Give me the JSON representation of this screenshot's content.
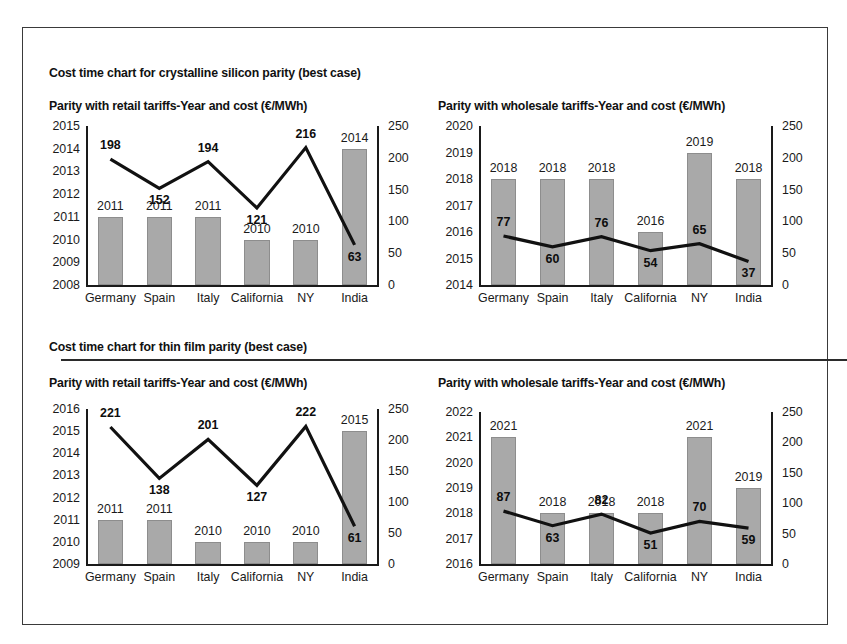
{
  "page": {
    "background": "#ffffff",
    "frame_color": "#3a3a3a",
    "bar_color": "#a9a9a9",
    "line_color": "#111111"
  },
  "sections": [
    {
      "title": "Cost time chart for crystalline silicon parity (best case)"
    },
    {
      "title": "Cost time chart for thin film parity (best case)"
    }
  ],
  "charts": [
    {
      "title": "Parity with retail tariffs-Year and cost (€/MWh)",
      "categories": [
        "Germany",
        "Spain",
        "Italy",
        "California",
        "NY",
        "India"
      ],
      "bar_values": [
        2011,
        2011,
        2011,
        2010,
        2010,
        2014
      ],
      "bar_labels": [
        "2011",
        "2011",
        "2011",
        "2010",
        "2010",
        "2014"
      ],
      "line_values": [
        198,
        152,
        194,
        121,
        216,
        63
      ],
      "line_labels": [
        "198",
        "152",
        "194",
        "121",
        "216",
        "63"
      ],
      "left_ticks": [
        "2015",
        "2014",
        "2013",
        "2012",
        "2011",
        "2010",
        "2009",
        "2008"
      ],
      "right_ticks": [
        "250",
        "200",
        "150",
        "100",
        "50",
        "0"
      ],
      "left_min": 2008,
      "left_max": 2015,
      "right_min": 0,
      "right_max": 250
    },
    {
      "title": "Parity with wholesale tariffs-Year and cost (€/MWh)",
      "categories": [
        "Germany",
        "Spain",
        "Italy",
        "California",
        "NY",
        "India"
      ],
      "bar_values": [
        2018,
        2018,
        2018,
        2016,
        2019,
        2018
      ],
      "bar_labels": [
        "2018",
        "2018",
        "2018",
        "2016",
        "2019",
        "2018"
      ],
      "line_values": [
        77,
        60,
        76,
        54,
        65,
        37
      ],
      "line_labels": [
        "77",
        "60",
        "76",
        "54",
        "65",
        "37"
      ],
      "left_ticks": [
        "2020",
        "2019",
        "2018",
        "2017",
        "2016",
        "2015",
        "2014"
      ],
      "right_ticks": [
        "250",
        "200",
        "150",
        "100",
        "50",
        "0"
      ],
      "left_min": 2014,
      "left_max": 2020,
      "right_min": 0,
      "right_max": 250
    },
    {
      "title": "Parity with retail tariffs-Year and cost (€/MWh)",
      "categories": [
        "Germany",
        "Spain",
        "Italy",
        "California",
        "NY",
        "India"
      ],
      "bar_values": [
        2011,
        2011,
        2010,
        2010,
        2010,
        2015
      ],
      "bar_labels": [
        "2011",
        "2011",
        "2010",
        "2010",
        "2010",
        "2015"
      ],
      "line_values": [
        221,
        138,
        201,
        127,
        222,
        61
      ],
      "line_labels": [
        "221",
        "138",
        "201",
        "127",
        "222",
        "61"
      ],
      "left_ticks": [
        "2016",
        "2015",
        "2014",
        "2013",
        "2012",
        "2011",
        "2010",
        "2009"
      ],
      "right_ticks": [
        "250",
        "200",
        "150",
        "100",
        "50",
        "0"
      ],
      "left_min": 2009,
      "left_max": 2016,
      "right_min": 0,
      "right_max": 250
    },
    {
      "title": "Parity with wholesale tariffs-Year and cost (€/MWh)",
      "categories": [
        "Germany",
        "Spain",
        "Italy",
        "California",
        "NY",
        "India"
      ],
      "bar_values": [
        2021,
        2018,
        2018,
        2018,
        2021,
        2019
      ],
      "bar_labels": [
        "2021",
        "2018",
        "2018",
        "2018",
        "2021",
        "2019"
      ],
      "line_values": [
        87,
        63,
        82,
        51,
        70,
        59
      ],
      "line_labels": [
        "87",
        "63",
        "82",
        "51",
        "70",
        "59"
      ],
      "left_ticks": [
        "2022",
        "2021",
        "2020",
        "2019",
        "2018",
        "2017",
        "2016"
      ],
      "right_ticks": [
        "250",
        "200",
        "150",
        "100",
        "50",
        "0"
      ],
      "left_min": 2016,
      "left_max": 2022,
      "right_min": 0,
      "right_max": 250
    }
  ],
  "chart_data": [
    {
      "type": "bar",
      "title": "Parity with retail tariffs-Year and cost (€/MWh) — crystalline silicon (best case)",
      "categories": [
        "Germany",
        "Spain",
        "Italy",
        "California",
        "NY",
        "India"
      ],
      "series": [
        {
          "name": "Parity year",
          "axis": "left",
          "type": "bar",
          "values": [
            2011,
            2011,
            2011,
            2010,
            2010,
            2014
          ]
        },
        {
          "name": "Cost (€/MWh)",
          "axis": "right",
          "type": "line",
          "values": [
            198,
            152,
            194,
            121,
            216,
            63
          ]
        }
      ],
      "xlabel": "",
      "ylabel": "Year",
      "y2label": "Cost (€/MWh)",
      "ylim": [
        2008,
        2015
      ],
      "y2lim": [
        0,
        250
      ],
      "grid": false,
      "legend": "none"
    },
    {
      "type": "bar",
      "title": "Parity with wholesale tariffs-Year and cost (€/MWh) — crystalline silicon (best case)",
      "categories": [
        "Germany",
        "Spain",
        "Italy",
        "California",
        "NY",
        "India"
      ],
      "series": [
        {
          "name": "Parity year",
          "axis": "left",
          "type": "bar",
          "values": [
            2018,
            2018,
            2018,
            2016,
            2019,
            2018
          ]
        },
        {
          "name": "Cost (€/MWh)",
          "axis": "right",
          "type": "line",
          "values": [
            77,
            60,
            76,
            54,
            65,
            37
          ]
        }
      ],
      "xlabel": "",
      "ylabel": "Year",
      "y2label": "Cost (€/MWh)",
      "ylim": [
        2014,
        2020
      ],
      "y2lim": [
        0,
        250
      ],
      "grid": false,
      "legend": "none"
    },
    {
      "type": "bar",
      "title": "Parity with retail tariffs-Year and cost (€/MWh) — thin film (best case)",
      "categories": [
        "Germany",
        "Spain",
        "Italy",
        "California",
        "NY",
        "India"
      ],
      "series": [
        {
          "name": "Parity year",
          "axis": "left",
          "type": "bar",
          "values": [
            2011,
            2011,
            2010,
            2010,
            2010,
            2015
          ]
        },
        {
          "name": "Cost (€/MWh)",
          "axis": "right",
          "type": "line",
          "values": [
            221,
            138,
            201,
            127,
            222,
            61
          ]
        }
      ],
      "xlabel": "",
      "ylabel": "Year",
      "y2label": "Cost (€/MWh)",
      "ylim": [
        2009,
        2016
      ],
      "y2lim": [
        0,
        250
      ],
      "grid": false,
      "legend": "none"
    },
    {
      "type": "bar",
      "title": "Parity with wholesale tariffs-Year and cost (€/MWh) — thin film (best case)",
      "categories": [
        "Germany",
        "Spain",
        "Italy",
        "California",
        "NY",
        "India"
      ],
      "series": [
        {
          "name": "Parity year",
          "axis": "left",
          "type": "bar",
          "values": [
            2021,
            2018,
            2018,
            2018,
            2021,
            2019
          ]
        },
        {
          "name": "Cost (€/MWh)",
          "axis": "right",
          "type": "line",
          "values": [
            87,
            63,
            82,
            51,
            70,
            59
          ]
        }
      ],
      "xlabel": "",
      "ylabel": "Year",
      "y2label": "Cost (€/MWh)",
      "ylim": [
        2016,
        2022
      ],
      "y2lim": [
        0,
        250
      ],
      "grid": false,
      "legend": "none"
    }
  ]
}
